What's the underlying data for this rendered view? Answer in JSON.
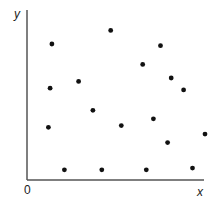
{
  "chart_data": {
    "type": "scatter",
    "title": "",
    "xlabel": "x",
    "ylabel": "y",
    "origin_label": "0",
    "grid": false,
    "legend": null,
    "xlim": [
      0,
      10
    ],
    "ylim": [
      0,
      10
    ],
    "points": [
      {
        "x": 1.4,
        "y": 8.0
      },
      {
        "x": 4.7,
        "y": 8.8
      },
      {
        "x": 7.5,
        "y": 7.9
      },
      {
        "x": 1.3,
        "y": 5.4
      },
      {
        "x": 2.9,
        "y": 5.8
      },
      {
        "x": 6.5,
        "y": 6.8
      },
      {
        "x": 8.1,
        "y": 6.0
      },
      {
        "x": 8.8,
        "y": 5.3
      },
      {
        "x": 3.7,
        "y": 4.1
      },
      {
        "x": 5.3,
        "y": 3.2
      },
      {
        "x": 7.1,
        "y": 3.6
      },
      {
        "x": 1.2,
        "y": 3.1
      },
      {
        "x": 10.0,
        "y": 2.7
      },
      {
        "x": 7.9,
        "y": 2.2
      },
      {
        "x": 2.1,
        "y": 0.6
      },
      {
        "x": 4.2,
        "y": 0.6
      },
      {
        "x": 6.7,
        "y": 0.6
      },
      {
        "x": 9.3,
        "y": 0.7
      }
    ]
  },
  "colors": {
    "axis": "#555555",
    "point": "#111111",
    "background": "#ffffff"
  }
}
